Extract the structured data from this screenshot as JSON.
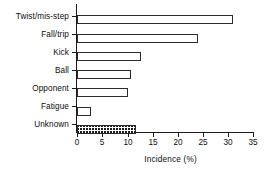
{
  "chart_data": {
    "type": "bar",
    "orientation": "horizontal",
    "title": "",
    "subtitle": "",
    "xlabel": "Incidence (%)",
    "ylabel": "",
    "xlim": [
      0,
      35
    ],
    "xticks": [
      0,
      5,
      10,
      15,
      20,
      25,
      30,
      35
    ],
    "grid": false,
    "legend": null,
    "categories": [
      "Twist/mis-step",
      "Fall/trip",
      "Kick",
      "Ball",
      "Opponent",
      "Fatigue",
      "Unknown"
    ],
    "values": [
      31.0,
      24.1,
      12.7,
      10.7,
      10.1,
      2.7,
      11.8
    ],
    "bar_styles": [
      "open",
      "open",
      "open",
      "open",
      "open",
      "open",
      "hatched"
    ],
    "colors": {
      "bar_fill": "#ffffff",
      "bar_edge": "#2b2b2b",
      "hatch": "#1a1a1a",
      "axis": "#1a1a1a",
      "text": "#0d0d0d",
      "background": "#ffffff"
    }
  }
}
